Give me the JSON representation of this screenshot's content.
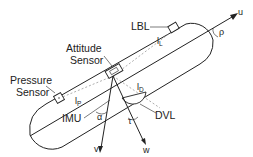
{
  "diagram": {
    "title": "",
    "type": "vehicle-sensor-layout",
    "colors": {
      "stroke": "#222222",
      "dashed": "#999999",
      "background": "#ffffff"
    },
    "labels": {
      "lbl": "LBL",
      "attitude_line1": "Attitude",
      "attitude_line2": "Sensor",
      "pressure_line1": "Pressure",
      "pressure_line2": "Sensor",
      "imu": "IMU",
      "dvl": "DVL"
    },
    "symbols": {
      "u": "u",
      "v": "v",
      "w": "w",
      "rho": "ρ",
      "alpha": "α",
      "tau": "τ",
      "l_L_base": "l",
      "l_L_sub": "L",
      "l_D_base": "l",
      "l_D_sub": "D",
      "l_P_base": "l",
      "l_P_sub": "P"
    },
    "nodes": [
      {
        "id": "lbl",
        "label": "LBL",
        "kind": "sensor-box"
      },
      {
        "id": "attitude",
        "label": "Attitude Sensor",
        "kind": "sensor-box"
      },
      {
        "id": "pressure",
        "label": "Pressure Sensor",
        "kind": "sensor-box"
      },
      {
        "id": "imu",
        "label": "IMU",
        "kind": "reference-point"
      },
      {
        "id": "dvl",
        "label": "DVL",
        "kind": "sensor-dome"
      }
    ],
    "edges": [
      {
        "from": "imu",
        "to": "lbl",
        "label": "l_L",
        "style": "dashed"
      },
      {
        "from": "imu",
        "to": "dvl",
        "label": "l_D",
        "style": "dashed"
      },
      {
        "from": "imu",
        "to": "pressure",
        "label": "l_P",
        "style": "dashed"
      }
    ],
    "axes": [
      {
        "name": "u",
        "direction": "forward"
      },
      {
        "name": "v",
        "direction": "down-left"
      },
      {
        "name": "w",
        "direction": "down-right"
      }
    ]
  }
}
